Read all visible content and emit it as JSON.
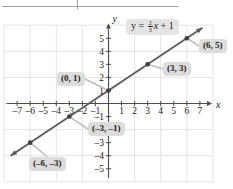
{
  "figure": {
    "title": "",
    "equation": {
      "lhs": "y",
      "equals": "=",
      "slope_numerator": "2",
      "slope_denominator": "3",
      "variable": "x",
      "plus": "+",
      "intercept": "1",
      "full_text": "y = 2/3 x + 1"
    },
    "axis_label_x": "x",
    "axis_label_y": "y",
    "colors": {
      "line": "#58595b",
      "point": "#3f4042",
      "grid": "#e3e3e6",
      "axis": "#4d4d4f",
      "callout_bg": "#dcdcdc",
      "equation_bg": "#e4e4e4",
      "text": "#1a1a1a",
      "top_rule": "#9aa0a6"
    },
    "callouts": [
      {
        "id": "p-0-1",
        "label": "(0, 1)",
        "point_x": 0,
        "point_y": 1,
        "box_left": 57,
        "box_top": 72
      },
      {
        "id": "p-3-3",
        "label": "(3, 3)",
        "point_x": 3,
        "point_y": 3,
        "box_left": 163,
        "box_top": 62
      },
      {
        "id": "p-6-5",
        "label": "(6, 5)",
        "point_x": 6,
        "point_y": 5,
        "box_left": 199,
        "box_top": 39
      },
      {
        "id": "p-n3-n1",
        "label": "(–3, –1)",
        "point_x": -3,
        "point_y": -1,
        "box_left": 88,
        "box_top": 122
      },
      {
        "id": "p-n6-n3",
        "label": "(–6, –3)",
        "point_x": -6,
        "point_y": -3,
        "box_left": 29,
        "box_top": 157
      }
    ]
  },
  "chart_data": {
    "type": "line",
    "title": "",
    "xlabel": "x",
    "ylabel": "y",
    "xlim": [
      -7.8,
      7.8
    ],
    "ylim": [
      -5.8,
      5.8
    ],
    "grid": true,
    "grid_step": 2,
    "tick_step": 1,
    "legend": "none",
    "equation": "y = (2/3)x + 1",
    "slope": 0.6666666667,
    "intercept": 1,
    "xticks": [
      -7,
      -6,
      -5,
      -4,
      -3,
      -2,
      -1,
      1,
      2,
      3,
      4,
      5,
      6,
      7
    ],
    "xtick_labels": [
      "–7",
      "–6",
      "–5",
      "–4",
      "–3",
      "–2",
      "–1",
      "1",
      "2",
      "3",
      "4",
      "5",
      "6",
      "7"
    ],
    "yticks": [
      -5,
      -4,
      -3,
      -2,
      -1,
      1,
      2,
      3,
      4,
      5
    ],
    "ytick_labels": [
      "–5",
      "–4",
      "–3",
      "–2",
      "–1",
      "1",
      "2",
      "3",
      "4",
      "5"
    ],
    "series": [
      {
        "name": "y = 2/3 x + 1",
        "type": "line",
        "arrows": "both",
        "x": [
          -7.5,
          7.2
        ],
        "y": [
          -4.0,
          5.8
        ],
        "marked_points": [
          {
            "x": -6,
            "y": -3,
            "label": "(–6, –3)"
          },
          {
            "x": -3,
            "y": -1,
            "label": "(–3, –1)"
          },
          {
            "x": 0,
            "y": 1,
            "label": "(0, 1)"
          },
          {
            "x": 3,
            "y": 3,
            "label": "(3, 3)"
          },
          {
            "x": 6,
            "y": 5,
            "label": "(6, 5)"
          }
        ]
      }
    ]
  }
}
